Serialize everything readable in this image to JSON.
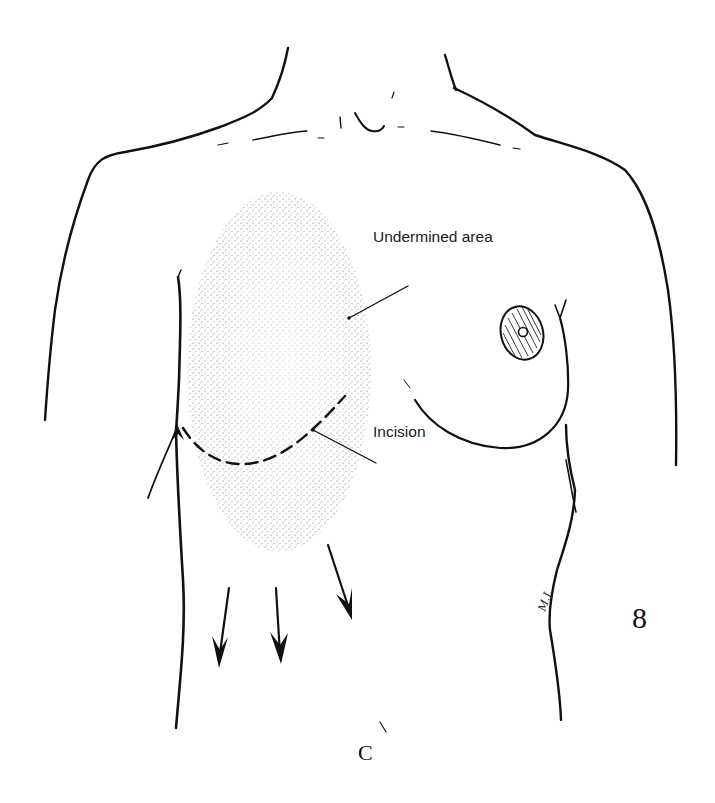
{
  "figure": {
    "number": "8",
    "stray_glyph": "C",
    "signature": "M.J."
  },
  "labels": {
    "undermined_area": "Undermined area",
    "incision": "Incision"
  },
  "colors": {
    "ink": "#111111",
    "stipple": "#555555",
    "background": "#ffffff"
  }
}
